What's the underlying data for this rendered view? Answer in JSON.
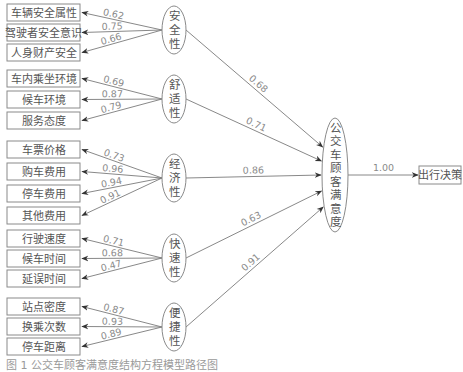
{
  "diagram": {
    "title": "公交车顾客满意度结构方程模型",
    "central_node": {
      "label": "公交车顾客满意度",
      "cx": 335,
      "cy": 175,
      "rx": 13,
      "ry": 57
    },
    "output_node": {
      "label": "出行决策",
      "x": 419,
      "y": 166,
      "w": 42,
      "h": 18
    },
    "central_to_output_coef": "1.00",
    "latent_factors": [
      {
        "label": "安全性",
        "cx": 174,
        "cy": 30,
        "rx": 12,
        "ry": 24,
        "path_coef": "0.68",
        "indicators": [
          {
            "label": "车辆安全属性",
            "y": 4,
            "loading": "0.62"
          },
          {
            "label": "驾驶者安全意识",
            "y": 24,
            "loading": "0.75"
          },
          {
            "label": "人身财产安全",
            "y": 44,
            "loading": "0.66"
          }
        ]
      },
      {
        "label": "舒适性",
        "cx": 174,
        "cy": 99,
        "rx": 12,
        "ry": 24,
        "path_coef": "0.71",
        "indicators": [
          {
            "label": "车内乘坐环境",
            "y": 70,
            "loading": "0.69"
          },
          {
            "label": "候车环境",
            "y": 91,
            "loading": "0.87"
          },
          {
            "label": "服务态度",
            "y": 112,
            "loading": "0.79"
          }
        ]
      },
      {
        "label": "经济性",
        "cx": 174,
        "cy": 178,
        "rx": 12,
        "ry": 24,
        "path_coef": "0.86",
        "indicators": [
          {
            "label": "车票价格",
            "y": 141,
            "loading": "0.73"
          },
          {
            "label": "购车费用",
            "y": 163,
            "loading": "0.96"
          },
          {
            "label": "停车费用",
            "y": 185,
            "loading": "0.94"
          },
          {
            "label": "其他费用",
            "y": 207,
            "loading": "0.91"
          }
        ]
      },
      {
        "label": "快速性",
        "cx": 174,
        "cy": 258,
        "rx": 12,
        "ry": 24,
        "path_coef": "0.63",
        "indicators": [
          {
            "label": "行驶速度",
            "y": 230,
            "loading": "0.71"
          },
          {
            "label": "候车时间",
            "y": 250,
            "loading": "0.68"
          },
          {
            "label": "延误时间",
            "y": 270,
            "loading": "0.47"
          }
        ]
      },
      {
        "label": "便捷性",
        "cx": 174,
        "cy": 327,
        "rx": 12,
        "ry": 24,
        "path_coef": "0.91",
        "indicators": [
          {
            "label": "站点密度",
            "y": 298,
            "loading": "0.87"
          },
          {
            "label": "换乘次数",
            "y": 318,
            "loading": "0.93"
          },
          {
            "label": "停车距离",
            "y": 338,
            "loading": "0.89"
          }
        ]
      }
    ],
    "caption": "图 1  公交车顾客满意度结构方程模型路径图"
  },
  "colors": {
    "line": "#7a7a7a",
    "box_border": "#8a8a8a",
    "text": "#555555",
    "coef": "#8a8a8a"
  }
}
